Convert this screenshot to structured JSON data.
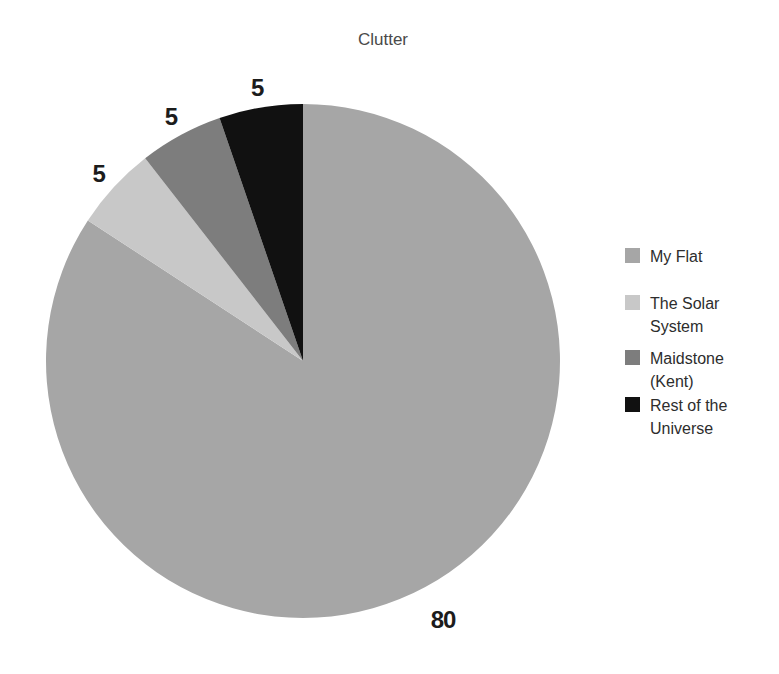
{
  "chart_data": {
    "type": "pie",
    "title": "Clutter",
    "categories": [
      "My Flat",
      "The Solar System",
      "Maidstone (Kent)",
      "Rest of the Universe"
    ],
    "values": [
      80,
      5,
      5,
      5
    ],
    "data_labels": [
      "80",
      "5",
      "5",
      "5"
    ],
    "colors": [
      "#a6a6a6",
      "#c8c8c8",
      "#7d7d7d",
      "#111111"
    ],
    "label_color": "#1c1c1c",
    "title_color": "#4a4a4a",
    "legend_position": "right",
    "start_angle_deg": 0,
    "direction": "clockwise"
  }
}
